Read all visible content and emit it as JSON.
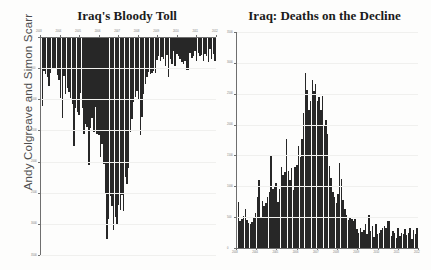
{
  "credit": {
    "text": "Andy Colgreave and Simon Scarr"
  },
  "charts": [
    {
      "id": "left",
      "title": "Iraq's Bloody Toll",
      "orientation": "inverted",
      "axis_position": "top"
    },
    {
      "id": "right",
      "title": "Iraq: Deaths on the Decline",
      "orientation": "upright",
      "axis_position": "bottom"
    }
  ],
  "chart_data": [
    {
      "type": "bar",
      "id": "iraqs-bloody-toll",
      "title": "Iraq's Bloody Toll",
      "subtitle": "",
      "xlabel": "",
      "ylabel": "",
      "orientation": "inverted",
      "note": "Bars hang downward from a top axis (blood-drip style). Values are monthly Iraqi civilian deaths.",
      "grid": true,
      "legend": null,
      "axis_side": "top",
      "xlim": [
        2003,
        2012
      ],
      "ylim": [
        0,
        3500
      ],
      "xtick_labels": [
        "2003",
        "2004",
        "2005",
        "2006",
        "2007",
        "2008",
        "2009",
        "2010",
        "2011",
        "2012"
      ],
      "ytick_labels": [
        "0",
        "500",
        "1000",
        "1500",
        "2000",
        "2500",
        "3000",
        "3500"
      ],
      "x": [
        "2003-03",
        "2003-04",
        "2003-05",
        "2003-06",
        "2003-07",
        "2003-08",
        "2003-09",
        "2003-10",
        "2003-11",
        "2003-12",
        "2004-01",
        "2004-02",
        "2004-03",
        "2004-04",
        "2004-05",
        "2004-06",
        "2004-07",
        "2004-08",
        "2004-09",
        "2004-10",
        "2004-11",
        "2004-12",
        "2005-01",
        "2005-02",
        "2005-03",
        "2005-04",
        "2005-05",
        "2005-06",
        "2005-07",
        "2005-08",
        "2005-09",
        "2005-10",
        "2005-11",
        "2005-12",
        "2006-01",
        "2006-02",
        "2006-03",
        "2006-04",
        "2006-05",
        "2006-06",
        "2006-07",
        "2006-08",
        "2006-09",
        "2006-10",
        "2006-11",
        "2006-12",
        "2007-01",
        "2007-02",
        "2007-03",
        "2007-04",
        "2007-05",
        "2007-06",
        "2007-07",
        "2007-08",
        "2007-09",
        "2007-10",
        "2007-11",
        "2007-12",
        "2008-01",
        "2008-02",
        "2008-03",
        "2008-04",
        "2008-05",
        "2008-06",
        "2008-07",
        "2008-08",
        "2008-09",
        "2008-10",
        "2008-11",
        "2008-12",
        "2009-01",
        "2009-02",
        "2009-03",
        "2009-04",
        "2009-05",
        "2009-06",
        "2009-07",
        "2009-08",
        "2009-09",
        "2009-10",
        "2009-11",
        "2009-12",
        "2010-01",
        "2010-02",
        "2010-03",
        "2010-04",
        "2010-05",
        "2010-06",
        "2010-07",
        "2010-08",
        "2010-09",
        "2010-10",
        "2010-11",
        "2010-12",
        "2011-01",
        "2011-02",
        "2011-03",
        "2011-04",
        "2011-05",
        "2011-06",
        "2011-07",
        "2011-08",
        "2011-09",
        "2011-10",
        "2011-11",
        "2011-12"
      ],
      "values": [
        3200,
        1100,
        550,
        590,
        640,
        780,
        570,
        520,
        490,
        520,
        610,
        690,
        980,
        1300,
        620,
        920,
        820,
        880,
        980,
        1080,
        1750,
        1140,
        1200,
        1250,
        900,
        1140,
        1560,
        1400,
        1450,
        2050,
        1460,
        1300,
        1520,
        1120,
        1550,
        1580,
        1930,
        1720,
        2040,
        2500,
        3240,
        2920,
        2550,
        2720,
        3100,
        2890,
        3020,
        2700,
        2780,
        2540,
        2800,
        2240,
        2360,
        2100,
        1520,
        1310,
        1050,
        960,
        860,
        1010,
        1570,
        1280,
        920,
        760,
        640,
        560,
        590,
        570,
        540,
        570,
        370,
        310,
        390,
        320,
        360,
        470,
        290,
        650,
        350,
        440,
        230,
        470,
        280,
        310,
        360,
        400,
        430,
        390,
        530,
        530,
        260,
        330,
        310,
        220,
        390,
        260,
        310,
        290,
        380,
        270,
        310,
        400,
        190,
        360,
        280,
        390
      ]
    },
    {
      "type": "bar",
      "id": "iraq-deaths-on-the-decline",
      "title": "Iraq: Deaths on the Decline",
      "subtitle": "",
      "xlabel": "",
      "ylabel": "",
      "orientation": "upright",
      "note": "Same data plotted conventionally upright from a bottom axis.",
      "grid": true,
      "legend": null,
      "axis_side": "bottom",
      "xlim": [
        2003,
        2012
      ],
      "ylim": [
        0,
        3500
      ],
      "xtick_labels": [
        "2003",
        "2004",
        "2005",
        "2006",
        "2007",
        "2008",
        "2009",
        "2010",
        "2011",
        "2012"
      ],
      "ytick_labels": [
        "0",
        "500",
        "1000",
        "1500",
        "2000",
        "2500",
        "3000",
        "3500"
      ],
      "x": [
        "2003-03",
        "2003-04",
        "2003-05",
        "2003-06",
        "2003-07",
        "2003-08",
        "2003-09",
        "2003-10",
        "2003-11",
        "2003-12",
        "2004-01",
        "2004-02",
        "2004-03",
        "2004-04",
        "2004-05",
        "2004-06",
        "2004-07",
        "2004-08",
        "2004-09",
        "2004-10",
        "2004-11",
        "2004-12",
        "2005-01",
        "2005-02",
        "2005-03",
        "2005-04",
        "2005-05",
        "2005-06",
        "2005-07",
        "2005-08",
        "2005-09",
        "2005-10",
        "2005-11",
        "2005-12",
        "2006-01",
        "2006-02",
        "2006-03",
        "2006-04",
        "2006-05",
        "2006-06",
        "2006-07",
        "2006-08",
        "2006-09",
        "2006-10",
        "2006-11",
        "2006-12",
        "2007-01",
        "2007-02",
        "2007-03",
        "2007-04",
        "2007-05",
        "2007-06",
        "2007-07",
        "2007-08",
        "2007-09",
        "2007-10",
        "2007-11",
        "2007-12",
        "2008-01",
        "2008-02",
        "2008-03",
        "2008-04",
        "2008-05",
        "2008-06",
        "2008-07",
        "2008-08",
        "2008-09",
        "2008-10",
        "2008-11",
        "2008-12",
        "2009-01",
        "2009-02",
        "2009-03",
        "2009-04",
        "2009-05",
        "2009-06",
        "2009-07",
        "2009-08",
        "2009-09",
        "2009-10",
        "2009-11",
        "2009-12",
        "2010-01",
        "2010-02",
        "2010-03",
        "2010-04",
        "2010-05",
        "2010-06",
        "2010-07",
        "2010-08",
        "2010-09",
        "2010-10",
        "2010-11",
        "2010-12",
        "2011-01",
        "2011-02",
        "2011-03",
        "2011-04",
        "2011-05",
        "2011-06",
        "2011-07",
        "2011-08",
        "2011-09",
        "2011-10",
        "2011-11",
        "2011-12"
      ],
      "values": [
        2550,
        740,
        430,
        470,
        520,
        640,
        450,
        410,
        390,
        420,
        490,
        560,
        820,
        1100,
        500,
        760,
        680,
        730,
        820,
        900,
        1500,
        960,
        1000,
        1060,
        740,
        960,
        1320,
        1180,
        1230,
        1760,
        1240,
        1100,
        1300,
        940,
        1320,
        1350,
        1660,
        1480,
        1760,
        2180,
        2830,
        2560,
        2240,
        2390,
        2730,
        2540,
        2660,
        2380,
        2450,
        2240,
        2470,
        1970,
        2080,
        1850,
        1330,
        1140,
        900,
        820,
        730,
        870,
        1380,
        1110,
        780,
        640,
        530,
        460,
        490,
        470,
        440,
        470,
        300,
        250,
        320,
        260,
        290,
        390,
        230,
        540,
        280,
        360,
        180,
        390,
        220,
        250,
        290,
        330,
        350,
        320,
        440,
        440,
        200,
        270,
        250,
        170,
        320,
        200,
        250,
        230,
        310,
        210,
        250,
        330,
        150,
        290,
        220,
        320
      ]
    }
  ]
}
